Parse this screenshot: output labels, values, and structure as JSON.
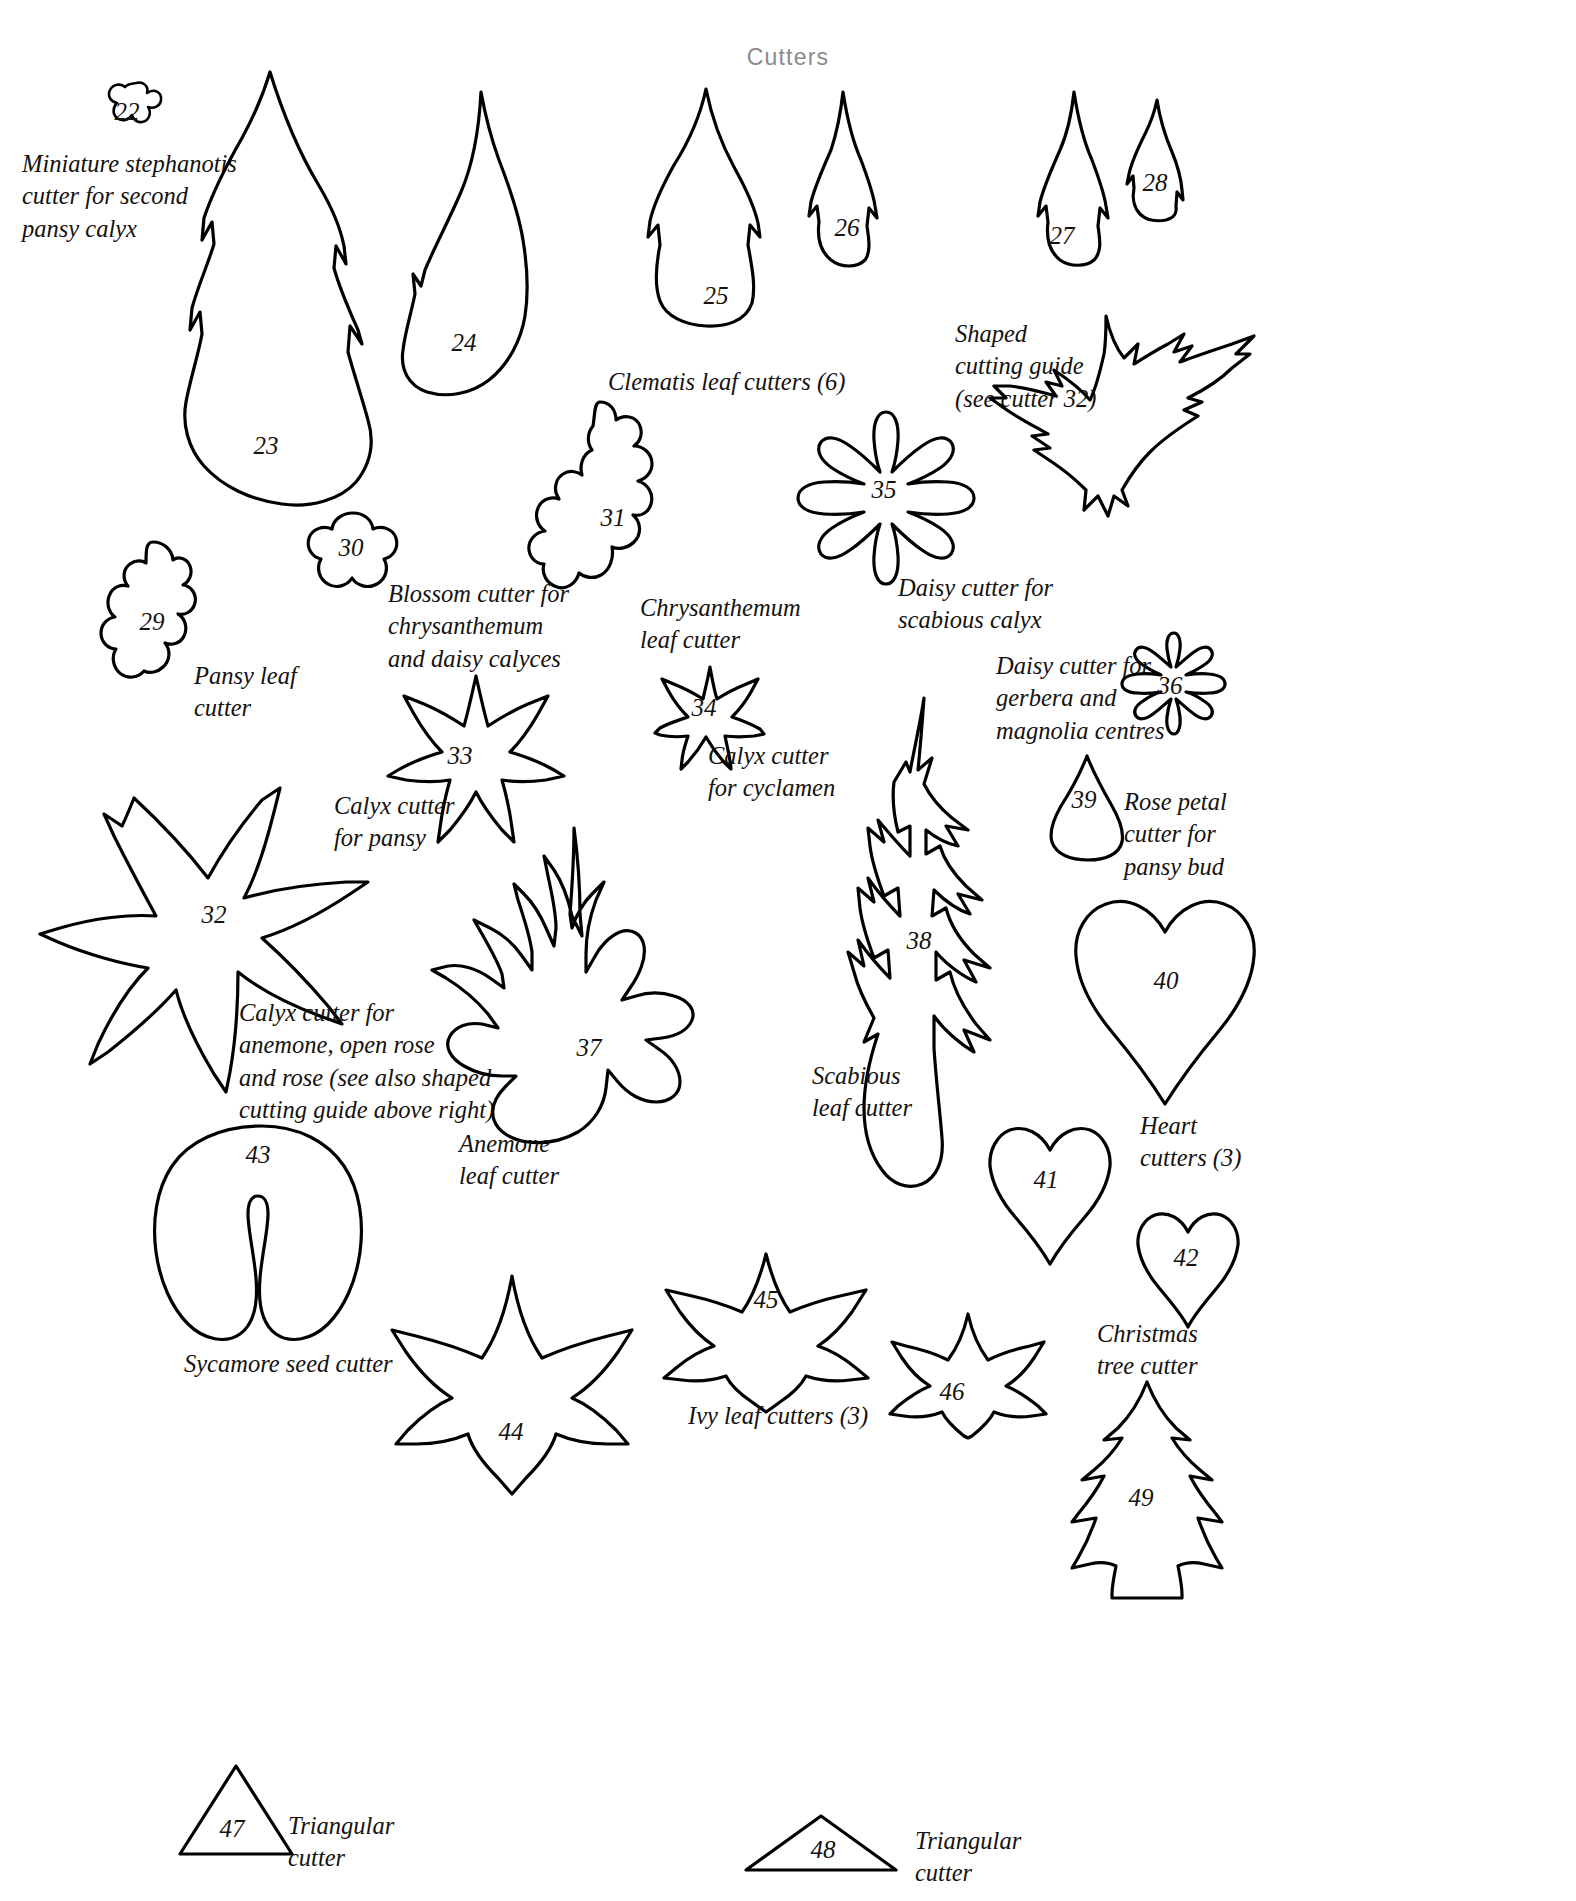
{
  "header": {
    "title": "Cutters"
  },
  "colors": {
    "ink": "#15120f",
    "outline": "#000000",
    "header": "#8a8a8a",
    "paper": "#ffffff"
  },
  "numbers": {
    "n22": "22",
    "n23": "23",
    "n24": "24",
    "n25": "25",
    "n26": "26",
    "n27": "27",
    "n28": "28",
    "n29": "29",
    "n30": "30",
    "n31": "31",
    "n32": "32",
    "n33": "33",
    "n34": "34",
    "n35": "35",
    "n36": "36",
    "n37": "37",
    "n38": "38",
    "n39": "39",
    "n40": "40",
    "n41": "41",
    "n42": "42",
    "n43": "43",
    "n44": "44",
    "n45": "45",
    "n46": "46",
    "n47": "47",
    "n48": "48",
    "n49": "49"
  },
  "captions": {
    "stephanotis": "Miniature stephanotis\ncutter for second\npansy calyx",
    "clematis": "Clematis leaf cutters (6)",
    "shaped_guide": "Shaped\ncutting guide\n(see cutter 32)",
    "pansy_leaf": "Pansy leaf\ncutter",
    "blossom": "Blossom cutter for\nchrysanthemum\nand daisy calyces",
    "chrysanthemum_leaf": "Chrysanthemum\nleaf cutter",
    "daisy_scabious": "Daisy cutter for\nscabious calyx",
    "daisy_gerbera": "Daisy cutter for\ngerbera and\nmagnolia centres",
    "calyx_pansy": "Calyx cutter\nfor pansy",
    "calyx_cyclamen": "Calyx cutter\nfor cyclamen",
    "rose_petal": "Rose petal\ncutter for\npansy bud",
    "calyx_anemone": "Calyx cutter for\nanemone, open rose\nand rose (see also shaped\ncutting guide above right)",
    "anemone_leaf": "Anemone\nleaf cutter",
    "scabious_leaf": "Scabious\nleaf cutter",
    "heart": "Heart\ncutters (3)",
    "sycamore": "Sycamore seed cutter",
    "ivy": "Ivy leaf cutters (3)",
    "christmas": "Christmas\ntree cutter",
    "triangular_left": "Triangular\ncutter",
    "triangular_right": "Triangular\ncutter"
  }
}
